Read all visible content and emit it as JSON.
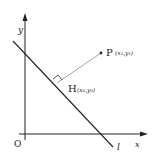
{
  "diagram": {
    "type": "coordinate-geometry",
    "axes": {
      "x_label": "x",
      "y_label": "y",
      "origin_label": "O"
    },
    "line_label": "l",
    "points": {
      "P": {
        "label": "P",
        "coords": "(x₁,y₁)"
      },
      "H": {
        "label": "H",
        "coords": "(x₀,y₀)"
      }
    },
    "colors": {
      "ink": "#222222",
      "segment": "#888888"
    }
  }
}
